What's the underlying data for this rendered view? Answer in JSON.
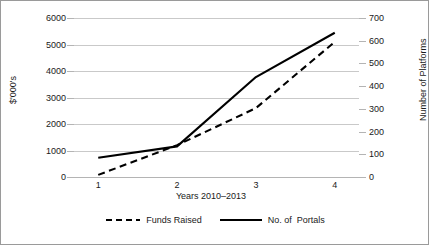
{
  "chart_data": {
    "type": "line",
    "title": "",
    "xlabel": "Years 2010–2013",
    "ylabel": "$'000's",
    "y2label": "Number of Platforms",
    "categories": [
      "1",
      "2",
      "3",
      "4"
    ],
    "x_tick_labels": [
      "1",
      "2",
      "3",
      "4"
    ],
    "y_tick_labels": [
      "0",
      "1000",
      "2000",
      "3000",
      "4000",
      "5000",
      "6000"
    ],
    "y2_tick_labels": [
      "0",
      "100",
      "200",
      "300",
      "400",
      "500",
      "600",
      "700"
    ],
    "ylim": [
      0,
      6000
    ],
    "y2lim": [
      0,
      700
    ],
    "grid": true,
    "legend_position": "bottom-center",
    "series": [
      {
        "name": "Funds Raised",
        "axis": "left",
        "style": "dashed",
        "color": "#000000",
        "values": [
          80,
          1200,
          2600,
          5100
        ]
      },
      {
        "name": "No. of  Portals",
        "axis": "right",
        "style": "solid",
        "color": "#000000",
        "values": [
          85,
          135,
          440,
          635
        ]
      }
    ]
  },
  "legend": {
    "items": [
      {
        "label": "Funds Raised",
        "style": "dashed"
      },
      {
        "label": "No. of  Portals",
        "style": "solid"
      }
    ]
  },
  "colors": {
    "line": "#000000",
    "grid": "#c9c9c9",
    "frame": "#9a9a9a",
    "text": "#1a1a1a"
  }
}
